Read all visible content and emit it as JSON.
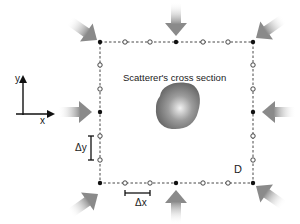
{
  "diagram": {
    "title": "Scatterer's cross section",
    "axes": {
      "x_label": "x",
      "y_label": "y"
    },
    "spacing_labels": {
      "dx": "Δx",
      "dy": "Δy"
    },
    "domain_label": "D",
    "boundary": {
      "style": "dashed",
      "shape": "square",
      "left": 100,
      "top": 42,
      "right": 253,
      "bottom": 183
    },
    "nodes": {
      "filled_description": "corners and edge midpoints (antenna positions)",
      "open_description": "intermediate sampling points, two between each pair of filled points"
    },
    "antennas": [
      {
        "id": "top-left",
        "direction": "down-right"
      },
      {
        "id": "top",
        "direction": "down"
      },
      {
        "id": "top-right",
        "direction": "down-left"
      },
      {
        "id": "right",
        "direction": "left"
      },
      {
        "id": "bottom-right",
        "direction": "up-left"
      },
      {
        "id": "bottom",
        "direction": "up"
      },
      {
        "id": "bottom-left",
        "direction": "up-right"
      },
      {
        "id": "left",
        "direction": "right"
      }
    ],
    "colors": {
      "antenna": "#7a7a7a",
      "scatterer": "#8c8c8c",
      "line": "#222222",
      "background": "#ffffff"
    }
  }
}
